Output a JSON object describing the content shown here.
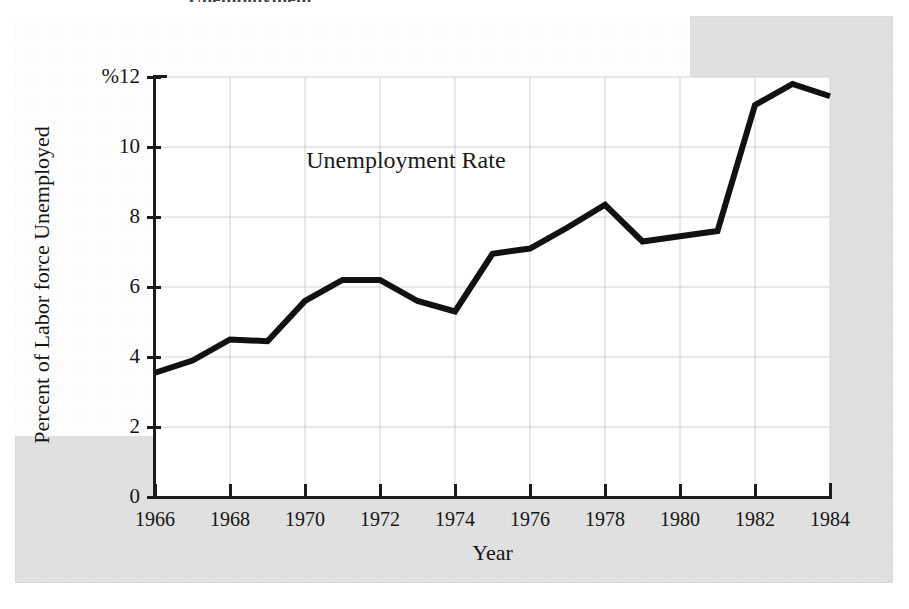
{
  "figure": {
    "cropped_title": "Unemployment",
    "background_color": "#e2e2e2",
    "plot_background_color": "#ffffff",
    "axis_color": "#1b1b1b",
    "grid_color": "#d2d2d2",
    "series_color": "#111111"
  },
  "chart_data": {
    "type": "line",
    "title": "Unemployment",
    "xlabel": "Year",
    "ylabel": "Percent of Labor force Unemployed",
    "annotations": [
      {
        "text": "Unemployment Rate",
        "x": 1974.3,
        "y": 9.6
      }
    ],
    "grid": true,
    "legend": "none",
    "xlim": [
      1966,
      1984
    ],
    "ylim": [
      0,
      12
    ],
    "xticks": [
      1966,
      1968,
      1970,
      1972,
      1974,
      1976,
      1978,
      1980,
      1982,
      1984
    ],
    "xtick_labels": [
      "1966",
      "1968",
      "1970",
      "1972",
      "1974",
      "1976",
      "1978",
      "1980",
      "1982",
      "1984"
    ],
    "yticks": [
      0,
      2,
      4,
      6,
      8,
      10,
      12
    ],
    "ytick_labels": [
      "0",
      "2",
      "4",
      "6",
      "8",
      "10",
      "%12"
    ],
    "series": [
      {
        "name": "Unemployment Rate",
        "x": [
          1966,
          1967,
          1968,
          1969,
          1970,
          1971,
          1972,
          1973,
          1974,
          1975,
          1976,
          1977,
          1978,
          1979,
          1980,
          1981,
          1982,
          1983,
          1984
        ],
        "values": [
          3.55,
          3.9,
          4.5,
          4.45,
          5.6,
          6.2,
          6.2,
          5.6,
          5.3,
          6.95,
          7.1,
          7.7,
          8.35,
          7.3,
          7.45,
          7.6,
          11.2,
          11.8,
          11.45
        ]
      }
    ]
  }
}
